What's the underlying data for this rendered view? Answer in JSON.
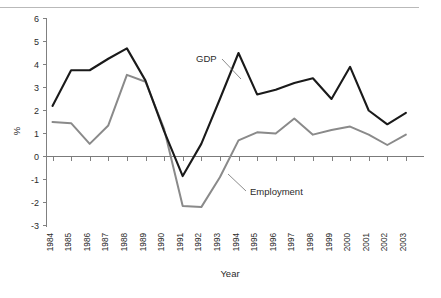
{
  "figure": {
    "partial_top_text": "",
    "background_color": "#ffffff"
  },
  "axes": {
    "y_label": "%",
    "x_label": "Year",
    "y_ticks": [
      "6",
      "5",
      "4",
      "3",
      "2",
      "1",
      "0",
      "-1",
      "-2",
      "-3"
    ],
    "x_ticks": [
      "1984",
      "1985",
      "1986",
      "1987",
      "1988",
      "1989",
      "1990",
      "1991",
      "1992",
      "1993",
      "1994",
      "1995",
      "1996",
      "1997",
      "1998",
      "1999",
      "2000",
      "2001",
      "2002",
      "2003"
    ]
  },
  "annotations": {
    "gdp_label": "GDP",
    "employment_label": "Employment"
  },
  "colors": {
    "gdp_line": "#1a1a1a",
    "employment_line": "#8a8a8a",
    "axis": "#808080",
    "zero_line": "#7b7b7b"
  },
  "chart_data": {
    "type": "line",
    "title": "",
    "xlabel": "Year",
    "ylabel": "%",
    "ylim": [
      -3,
      6
    ],
    "grid": false,
    "legend": "inline annotations",
    "categories": [
      "1984",
      "1985",
      "1986",
      "1987",
      "1988",
      "1989",
      "1990",
      "1991",
      "1992",
      "1993",
      "1994",
      "1995",
      "1996",
      "1997",
      "1998",
      "1999",
      "2000",
      "2001",
      "2002",
      "2003"
    ],
    "series": [
      {
        "name": "GDP",
        "color": "#1a1a1a",
        "values": [
          2.2,
          3.75,
          3.75,
          4.25,
          4.7,
          3.3,
          1.1,
          -0.85,
          0.55,
          2.5,
          4.5,
          2.7,
          2.9,
          3.2,
          3.4,
          2.5,
          3.9,
          2.0,
          1.4,
          1.9
        ]
      },
      {
        "name": "Employment",
        "color": "#8a8a8a",
        "values": [
          1.5,
          1.45,
          0.55,
          1.35,
          3.55,
          3.25,
          1.2,
          -2.15,
          -2.2,
          -0.9,
          0.7,
          1.05,
          1.0,
          1.65,
          0.95,
          1.15,
          1.3,
          0.95,
          0.5,
          0.95
        ]
      }
    ]
  }
}
